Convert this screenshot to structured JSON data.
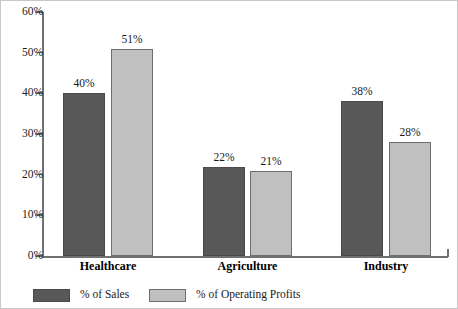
{
  "chart_data": {
    "type": "bar",
    "title": "",
    "subtitle": "",
    "xlabel": "",
    "ylabel": "",
    "categories": [
      "Healthcare",
      "Agriculture",
      "Industry"
    ],
    "series": [
      {
        "name": "% of Sales",
        "color": "#585858",
        "values": [
          40,
          22,
          38
        ],
        "labels": [
          "40%",
          "22%",
          "38%"
        ]
      },
      {
        "name": "% of Operating Profits",
        "color": "#c0c0c0",
        "values": [
          51,
          21,
          28
        ],
        "labels": [
          "51%",
          "21%",
          "28%"
        ]
      }
    ],
    "ylim": [
      0,
      60
    ],
    "ytick_step": 10,
    "ytick_labels": [
      "0%",
      "10%",
      "20%",
      "30%",
      "40%",
      "50%",
      "60%"
    ],
    "ytick_values": [
      0,
      10,
      20,
      30,
      40,
      50,
      60
    ],
    "grid": false,
    "legend_position": "bottom",
    "value_labels_shown": true
  },
  "legend": {
    "items": [
      {
        "label": "% of Sales",
        "color": "#585858"
      },
      {
        "label": "% of Operating Profits",
        "color": "#c0c0c0"
      }
    ]
  }
}
